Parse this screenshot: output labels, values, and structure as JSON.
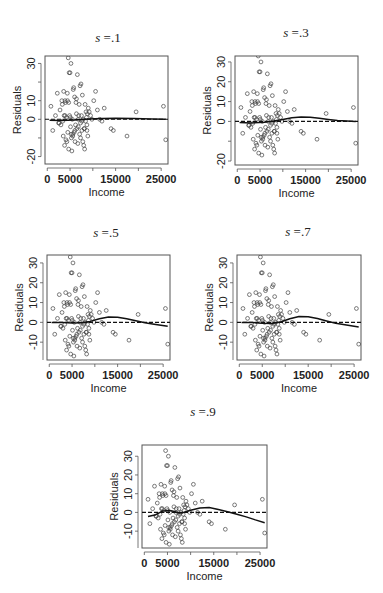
{
  "figure": {
    "width": 383,
    "height": 593
  },
  "chart_data": [
    {
      "type": "scatter",
      "title": "s =.1",
      "s": ".1",
      "xlabel": "Income",
      "ylabel": "Residuals",
      "xlim": [
        -500,
        26500
      ],
      "ylim": [
        -24,
        34
      ],
      "xticks": [
        0,
        5000,
        15000,
        25000
      ],
      "xtick_labels": [
        "0",
        "5000",
        "15000",
        "25000"
      ],
      "yticks": [
        -20,
        0,
        10,
        30
      ],
      "ytick_labels": [
        "-20",
        "0",
        "10",
        "30"
      ],
      "frame": {
        "left": 45,
        "top": 56,
        "right": 168,
        "bottom": 164
      },
      "title_pos": {
        "x": 108,
        "y": 38
      },
      "reference_line": {
        "y": 0,
        "style": "dashed"
      },
      "smooth": {
        "x": [
          500,
          3000,
          6000,
          9000,
          12000,
          15000,
          19000,
          23000,
          26000
        ],
        "y": [
          -0.5,
          -0.6,
          -0.3,
          0.1,
          0.5,
          0.6,
          0.4,
          0.2,
          0
        ]
      }
    },
    {
      "type": "scatter",
      "title": "s =.3",
      "s": ".3",
      "xlabel": "Income",
      "ylabel": "Residuals",
      "xlim": [
        -500,
        26500
      ],
      "ylim": [
        -22,
        33
      ],
      "xticks": [
        0,
        5000,
        15000,
        25000
      ],
      "xtick_labels": [
        "0",
        "5000",
        "15000",
        "25000"
      ],
      "yticks": [
        -20,
        0,
        10,
        20,
        30
      ],
      "ytick_labels": [
        "-20",
        "0",
        "10",
        "20",
        "30"
      ],
      "frame": {
        "left": 235,
        "top": 56,
        "right": 358,
        "bottom": 165
      },
      "title_pos": {
        "x": 296,
        "y": 33
      },
      "reference_line": {
        "y": 0,
        "style": "dashed"
      },
      "smooth": {
        "x": [
          500,
          3000,
          6000,
          8000,
          10000,
          12000,
          14000,
          16000,
          18000,
          20000,
          22000,
          24000,
          26000
        ],
        "y": [
          -0.5,
          -0.8,
          -0.4,
          0.2,
          1.0,
          1.8,
          2.2,
          2.1,
          1.6,
          1.0,
          0.5,
          0.2,
          0
        ]
      }
    },
    {
      "type": "scatter",
      "title": "s =.5",
      "s": ".5",
      "xlabel": "Income",
      "ylabel": "Residuals",
      "xlim": [
        -500,
        26500
      ],
      "ylim": [
        -19,
        34
      ],
      "xticks": [
        0,
        5000,
        15000,
        25000
      ],
      "xtick_labels": [
        "0",
        "5000",
        "15000",
        "25000"
      ],
      "yticks": [
        -10,
        0,
        10,
        20,
        30
      ],
      "ytick_labels": [
        "-10",
        "0",
        "10",
        "20",
        "30"
      ],
      "frame": {
        "left": 47,
        "top": 255,
        "right": 170,
        "bottom": 360
      },
      "title_pos": {
        "x": 106,
        "y": 233
      },
      "reference_line": {
        "y": 0,
        "style": "dashed"
      },
      "smooth": {
        "x": [
          500,
          3000,
          5000,
          7000,
          9000,
          11000,
          13000,
          15000,
          17000,
          19000,
          21000,
          23000,
          26000
        ],
        "y": [
          0,
          0,
          -0.3,
          -0.2,
          0.5,
          1.8,
          2.7,
          2.6,
          1.8,
          0.8,
          -0.2,
          -1.0,
          -2.0
        ]
      }
    },
    {
      "type": "scatter",
      "title": "s =.7",
      "s": ".7",
      "xlabel": "Income",
      "ylabel": "Residuals",
      "xlim": [
        -500,
        26500
      ],
      "ylim": [
        -19,
        34
      ],
      "xticks": [
        0,
        5000,
        15000,
        25000
      ],
      "xtick_labels": [
        "0",
        "5000",
        "15000",
        "25000"
      ],
      "yticks": [
        -10,
        0,
        10,
        20,
        30
      ],
      "ytick_labels": [
        "-10",
        "0",
        "10",
        "20",
        "30"
      ],
      "frame": {
        "left": 237,
        "top": 255,
        "right": 361,
        "bottom": 360
      },
      "title_pos": {
        "x": 298,
        "y": 232
      },
      "reference_line": {
        "y": 0,
        "style": "dashed"
      },
      "smooth": {
        "x": [
          500,
          3000,
          5000,
          7000,
          9000,
          11000,
          13000,
          15000,
          17000,
          19000,
          21000,
          23000,
          26000
        ],
        "y": [
          0,
          -0.1,
          -0.5,
          -0.6,
          0.2,
          1.8,
          2.9,
          2.8,
          1.9,
          0.7,
          -0.4,
          -1.2,
          -2.3
        ]
      }
    },
    {
      "type": "scatter",
      "title": "s =.9",
      "s": ".9",
      "xlabel": "Income",
      "ylabel": "Residuals",
      "xlim": [
        -500,
        26500
      ],
      "ylim": [
        -19,
        36
      ],
      "xticks": [
        0,
        5000,
        15000,
        25000
      ],
      "xtick_labels": [
        "0",
        "5000",
        "15000",
        "25000"
      ],
      "yticks": [
        -10,
        0,
        10,
        20,
        30
      ],
      "ytick_labels": [
        "-10",
        "0",
        "10",
        "20",
        "30"
      ],
      "frame": {
        "left": 142,
        "top": 445,
        "right": 267,
        "bottom": 548
      },
      "title_pos": {
        "x": 203,
        "y": 412
      },
      "reference_line": {
        "y": 0,
        "style": "dashed"
      },
      "smooth": {
        "x": [
          800,
          2500,
          4000,
          5500,
          6500,
          7500,
          8500,
          10000,
          12000,
          14000,
          16000,
          18000,
          20000,
          22000,
          24000,
          26000
        ],
        "y": [
          -2.2,
          -1.2,
          0.8,
          1.0,
          0.5,
          -0.3,
          0.0,
          1.2,
          2.4,
          2.6,
          1.6,
          0.4,
          -1.0,
          -2.4,
          -4.0,
          -5.5
        ]
      }
    }
  ],
  "points": {
    "x": [
      800,
      1200,
      1800,
      2200,
      2500,
      2800,
      3000,
      3200,
      3300,
      3500,
      3600,
      3700,
      3800,
      3900,
      4000,
      4100,
      4200,
      4300,
      4400,
      4500,
      4600,
      4700,
      4800,
      4900,
      5000,
      5100,
      5200,
      5300,
      5400,
      5500,
      5600,
      5700,
      5800,
      5900,
      6000,
      6100,
      6200,
      6300,
      6400,
      6500,
      6600,
      6700,
      6800,
      6900,
      7000,
      7100,
      7200,
      7300,
      7400,
      7500,
      7600,
      7700,
      7800,
      7900,
      8000,
      8100,
      8200,
      8300,
      8400,
      8500,
      8600,
      8700,
      8800,
      8900,
      9000,
      9200,
      9500,
      9800,
      10200,
      10600,
      11000,
      11500,
      12000,
      12500,
      14000,
      14500,
      17500,
      19500,
      25500,
      26000,
      2600,
      3400,
      4450,
      5050,
      5250,
      6050,
      6800,
      7600,
      8150,
      3900,
      4700,
      5600,
      6400,
      7300,
      8700
    ],
    "y": [
      7,
      -6,
      2,
      14,
      -2,
      5,
      -3,
      10,
      8,
      -9,
      15,
      2,
      -14,
      10,
      9,
      -11,
      1,
      -12,
      14,
      -7,
      33,
      -16,
      25,
      2,
      25,
      -4,
      30,
      -10,
      -17,
      0,
      -9,
      16,
      17,
      -7,
      12,
      -12,
      -3,
      9,
      11,
      -5,
      24,
      -13,
      -4,
      2,
      8,
      -8,
      18,
      -10,
      19,
      2,
      -6,
      13,
      -12,
      0,
      -14,
      -5,
      -16,
      8,
      -1,
      4,
      1,
      -3,
      3,
      -9,
      6,
      4,
      2,
      0,
      10,
      15,
      5,
      0,
      -1,
      6,
      -5,
      -6,
      -9,
      4,
      7,
      -11,
      -2,
      -1,
      10,
      1,
      -8,
      -6,
      0,
      -1,
      -5,
      2,
      9,
      -8,
      3,
      -2,
      -6
    ]
  }
}
